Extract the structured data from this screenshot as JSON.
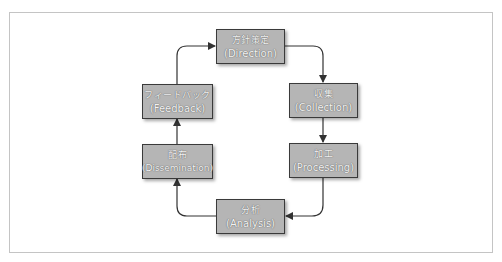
{
  "diagram": {
    "type": "cycle",
    "title": "",
    "nodes": [
      {
        "id": "direction",
        "jp": "方針策定",
        "en": "(Direction)"
      },
      {
        "id": "collection",
        "jp": "収集",
        "en": "(Collection)"
      },
      {
        "id": "processing",
        "jp": "加工",
        "en": "(Processing)"
      },
      {
        "id": "analysis",
        "jp": "分析",
        "en": "(Analysis)"
      },
      {
        "id": "dissemination",
        "jp": "配布",
        "en": "(Dissemination)"
      },
      {
        "id": "feedback",
        "jp": "フィードバック",
        "en": "(Feedback)"
      }
    ],
    "edges": [
      {
        "from": "direction",
        "to": "collection"
      },
      {
        "from": "collection",
        "to": "processing"
      },
      {
        "from": "processing",
        "to": "analysis"
      },
      {
        "from": "analysis",
        "to": "dissemination"
      },
      {
        "from": "dissemination",
        "to": "feedback"
      },
      {
        "from": "feedback",
        "to": "direction"
      }
    ],
    "colors": {
      "node_fill": "#b5b5b5",
      "node_border": "#3a3a3a",
      "arrow": "#333333",
      "frame_border": "#c4c4c4"
    }
  }
}
